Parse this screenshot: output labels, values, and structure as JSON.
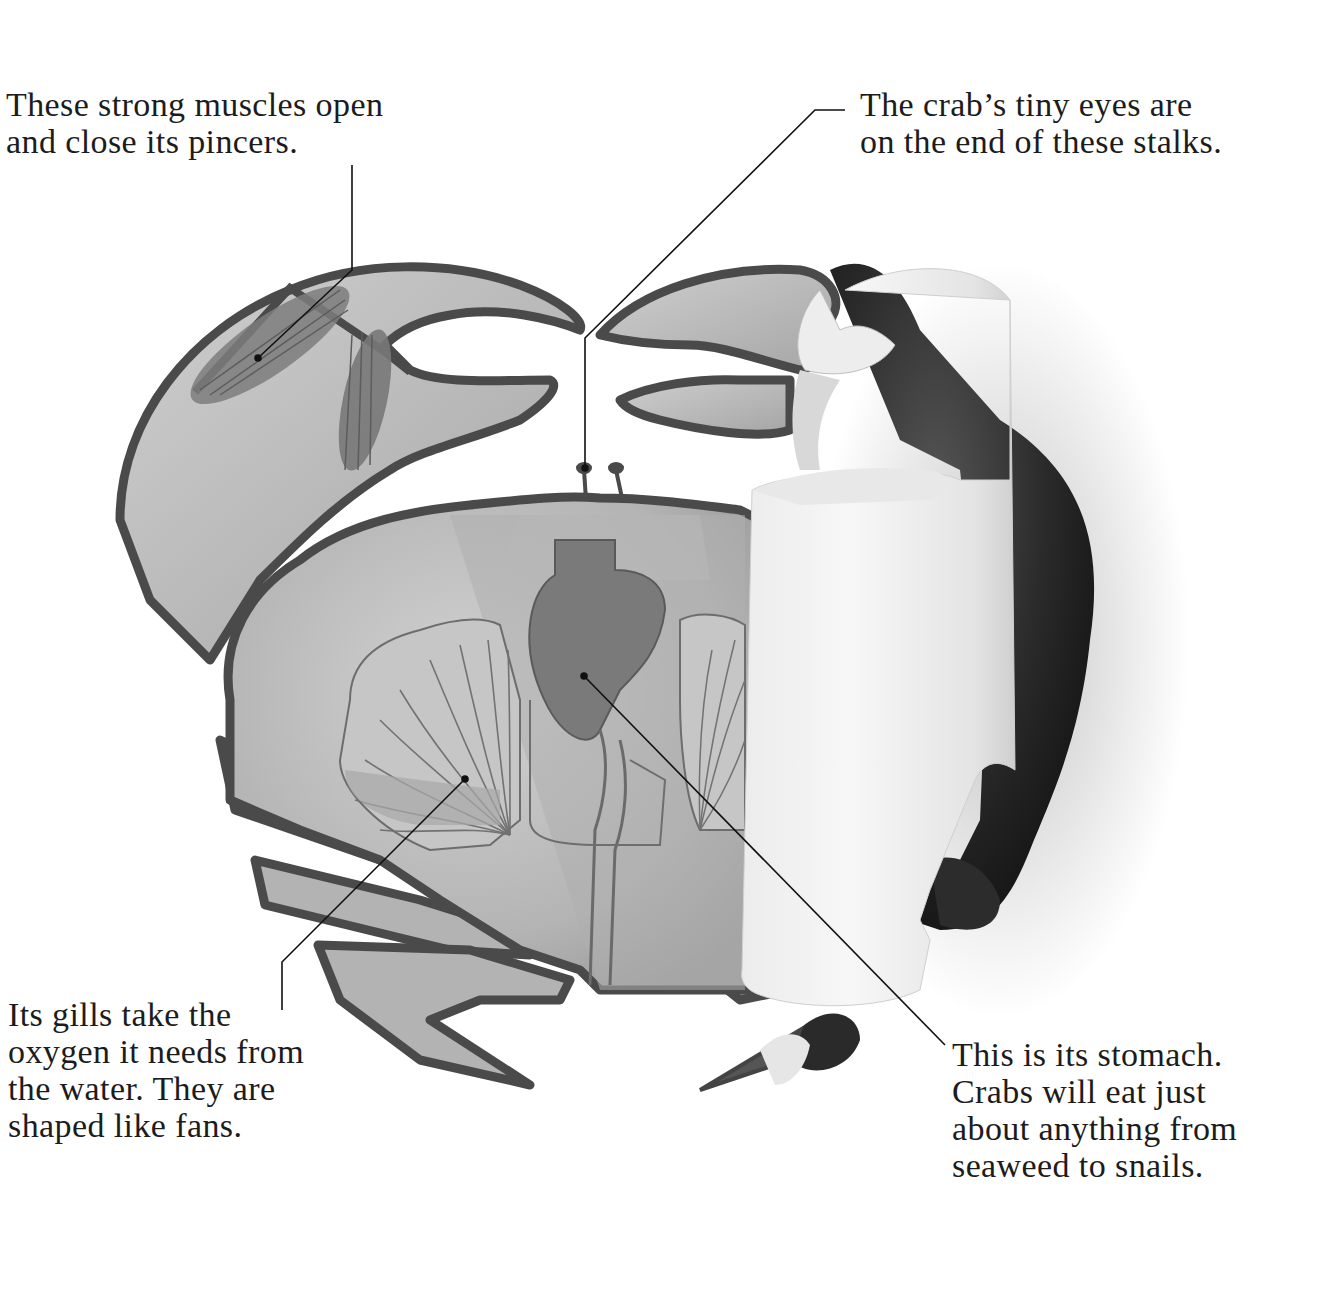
{
  "diagram": {
    "colors": {
      "background": "#ffffff",
      "outline": "#4a4a4a",
      "shell_fill": "#b9b9b9",
      "muscle_fill": "#7d7d7d",
      "gill_fill": "#c6c6c6",
      "stomach_fill": "#7a7a7a",
      "real_crab_dark": "#1f1f1f",
      "paper_curl": "#f1f1f1",
      "leader_line": "#111111",
      "text": "#1c1c1c"
    }
  },
  "labels": {
    "muscles": {
      "lines": [
        "These strong muscles open",
        "and close its pincers."
      ]
    },
    "eyes": {
      "lines": [
        "The crab’s tiny eyes are",
        "on the end of these stalks."
      ]
    },
    "gills": {
      "lines": [
        "Its gills take the",
        "oxygen it needs from",
        "the water. They are",
        "shaped like fans."
      ]
    },
    "stomach": {
      "lines": [
        "This is its stomach.",
        "Crabs will eat just",
        "about anything from",
        "seaweed to snails."
      ]
    }
  }
}
